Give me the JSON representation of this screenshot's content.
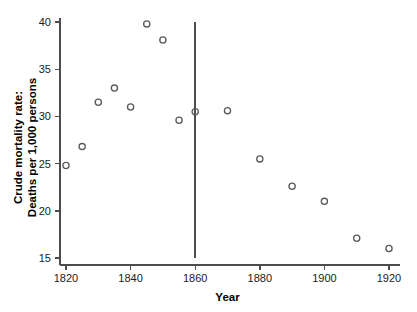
{
  "chart_data": {
    "type": "scatter",
    "title": "",
    "xlabel": "Year",
    "ylabel": "Crude mortality rate:\nDeaths per 1,000 persons",
    "ylabel_line1": "Crude mortality rate:",
    "ylabel_line2": "Deaths per 1,000 persons",
    "xlim": [
      1815,
      1925
    ],
    "ylim": [
      14.2,
      40.6
    ],
    "xticks": [
      1820,
      1840,
      1860,
      1880,
      1900,
      1920
    ],
    "xtick_labels": [
      "1820",
      "1840",
      "1860",
      "1880",
      "1900",
      "1920"
    ],
    "yticks": [
      15,
      20,
      25,
      30,
      35,
      40
    ],
    "ytick_labels": [
      "15",
      "20",
      "25",
      "30",
      "35",
      "40"
    ],
    "grid": false,
    "legend": "none",
    "marker_style": "open-circle",
    "marker_color": "#5a5a5a",
    "axis_color": "#4d4d4d",
    "x": [
      1820,
      1825,
      1830,
      1835,
      1840,
      1845,
      1850,
      1855,
      1860,
      1870,
      1880,
      1890,
      1900,
      1910,
      1920
    ],
    "y": [
      24.8,
      26.8,
      31.5,
      33.0,
      31.0,
      39.8,
      38.1,
      29.6,
      30.5,
      30.6,
      25.5,
      22.6,
      21.0,
      17.1,
      16.0
    ],
    "points": [
      {
        "x": 1820,
        "y": 24.8
      },
      {
        "x": 1825,
        "y": 26.8
      },
      {
        "x": 1830,
        "y": 31.5
      },
      {
        "x": 1835,
        "y": 33.0
      },
      {
        "x": 1840,
        "y": 31.0
      },
      {
        "x": 1845,
        "y": 39.8
      },
      {
        "x": 1850,
        "y": 38.1
      },
      {
        "x": 1855,
        "y": 29.6
      },
      {
        "x": 1860,
        "y": 30.5
      },
      {
        "x": 1870,
        "y": 30.6
      },
      {
        "x": 1880,
        "y": 25.5
      },
      {
        "x": 1890,
        "y": 22.6
      },
      {
        "x": 1900,
        "y": 21.0
      },
      {
        "x": 1910,
        "y": 17.1
      },
      {
        "x": 1920,
        "y": 16.0
      }
    ],
    "annotations": [
      {
        "type": "vertical-reference-line",
        "x": 1860,
        "y_start": 15,
        "y_end": 40,
        "label": ""
      }
    ]
  }
}
